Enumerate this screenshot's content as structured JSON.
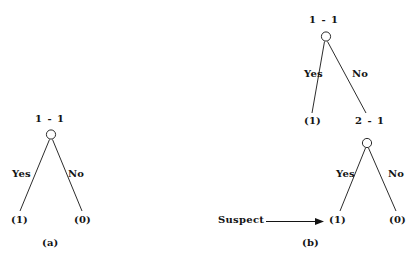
{
  "figure": {
    "background_color": "#ffffff",
    "stroke_color": "#141414",
    "panels": [
      {
        "id": "panel-a",
        "caption": "(a)",
        "root": {
          "label": "1 - 1",
          "shape": "circle-node"
        },
        "edges": [
          {
            "label": "Yes",
            "side": "left"
          },
          {
            "label": "No",
            "side": "right"
          }
        ],
        "leaves": [
          {
            "label": "(1)",
            "side": "left"
          },
          {
            "label": "(0)",
            "side": "right"
          }
        ]
      },
      {
        "id": "panel-b",
        "caption": "(b)",
        "input_label": "Suspect",
        "input_arrow": "arrow-right",
        "upper_tree": {
          "root": {
            "label": "1 - 1",
            "shape": "circle-node"
          },
          "edges": [
            {
              "label": "Yes",
              "side": "left"
            },
            {
              "label": "No",
              "side": "right"
            }
          ],
          "leaves": [
            {
              "label": "(1)",
              "side": "left"
            },
            {
              "label": "2 - 1",
              "side": "right"
            }
          ]
        },
        "lower_tree": {
          "root": {
            "label": "2 - 1",
            "shape": "circle-node"
          },
          "edges": [
            {
              "label": "Yes",
              "side": "left"
            },
            {
              "label": "No",
              "side": "right"
            }
          ],
          "leaves": [
            {
              "label": "(1)",
              "side": "left"
            },
            {
              "label": "(0)",
              "side": "right"
            }
          ]
        }
      }
    ]
  }
}
